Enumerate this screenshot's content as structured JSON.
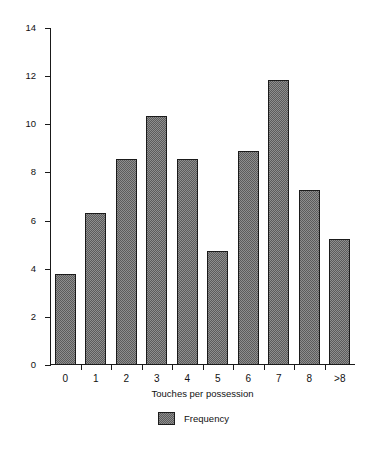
{
  "chart_data": {
    "type": "bar",
    "title": "",
    "xlabel": "Touches per possession",
    "ylabel": "Goals per 1000 possessions",
    "categories": [
      "0",
      "1",
      "2",
      "3",
      "4",
      "5",
      "6",
      "7",
      "8",
      ">8"
    ],
    "values": [
      3.8,
      6.3,
      8.55,
      10.35,
      8.55,
      4.75,
      8.9,
      11.85,
      7.25,
      5.25
    ],
    "series": [
      {
        "name": "Frequency",
        "values": [
          3.8,
          6.3,
          8.55,
          10.35,
          8.55,
          4.75,
          8.9,
          11.85,
          7.25,
          5.25
        ]
      }
    ],
    "ylim": [
      0,
      14
    ],
    "yticks": [
      0,
      2,
      4,
      6,
      8,
      10,
      12,
      14
    ],
    "ytick_labels": [
      "0",
      "2",
      "4",
      "6",
      "8",
      "10",
      "12",
      "14"
    ],
    "grid": false,
    "legend": {
      "position": "bottom-center",
      "entries": [
        "Frequency"
      ]
    },
    "colors": {
      "bar_fill": "#8e8e8e",
      "bar_pattern": "#5c5c5c",
      "bar_edge": "#1b1b1b",
      "axis": "#1a1a1a",
      "text": "#111111",
      "background": "#ffffff"
    }
  }
}
